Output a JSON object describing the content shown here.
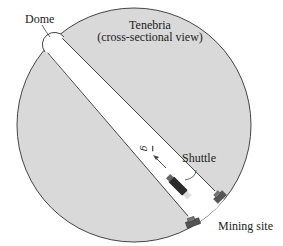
{
  "diagram": {
    "title": "Tenebria",
    "subtitle": "(cross-sectional view)",
    "labels": {
      "dome": "Dome",
      "shuttle": "Shuttle",
      "mining_site": "Mining site",
      "gravity_vector": "g"
    },
    "colors": {
      "planet_fill": "#d9d9d9",
      "outline": "#444444",
      "tunnel_fill": "#ffffff",
      "shuttle_body": "#2b2b2b",
      "structure": "#555555"
    }
  }
}
